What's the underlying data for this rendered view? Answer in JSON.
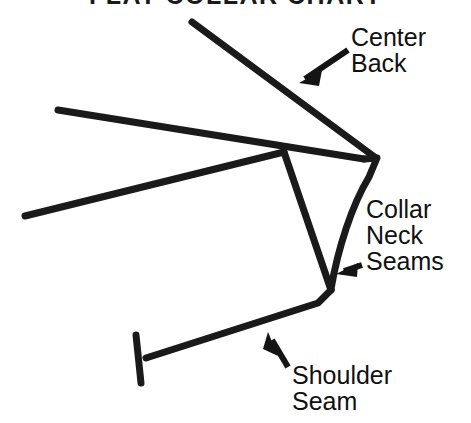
{
  "page": {
    "title": "FLAT COLLAR CHART",
    "background_color": "#ffffff",
    "ink_color": "#1a1a1a",
    "width": 471,
    "height": 423
  },
  "annotations": {
    "center_back": {
      "label": "Center\nBack",
      "arrow": "arrow-pointing-down-left"
    },
    "collar_neck_seams": {
      "label": "Collar\nNeck\nSeams",
      "arrow": "arrow-pointing-left"
    },
    "shoulder_seam": {
      "label": "Shoulder\nSeam",
      "arrow": "arrow-pointing-up-left"
    }
  },
  "diagram": {
    "name": "flat-collar-pattern-line-drawing",
    "stroke_color": "#1a1a1a",
    "stroke_width": 7,
    "parts": [
      {
        "name": "center-back-line",
        "points": "192,22 376,158"
      },
      {
        "name": "collar-upper-edge",
        "points": "58,110 363,160"
      },
      {
        "name": "collar-point-right",
        "points": "363,160 376,158 368,176 330,290"
      },
      {
        "name": "collar-lower-edge",
        "points": "25,216 283,152"
      },
      {
        "name": "neck-seam-inner",
        "points": "283,152 330,290"
      },
      {
        "name": "shoulder-seam-line",
        "points": "330,290 318,302 145,358"
      },
      {
        "name": "shoulder-end-tick",
        "points": "136,334 140,382"
      }
    ]
  }
}
